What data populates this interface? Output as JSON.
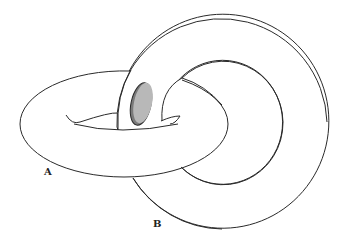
{
  "diagram": {
    "labels": {
      "torus_a": "A",
      "torus_b": "B"
    },
    "colors": {
      "stroke": "#2a2a2a",
      "fill": "#ffffff",
      "disk_fill": "#b8b8b8",
      "disk_edge": "#7a7a7a"
    }
  }
}
